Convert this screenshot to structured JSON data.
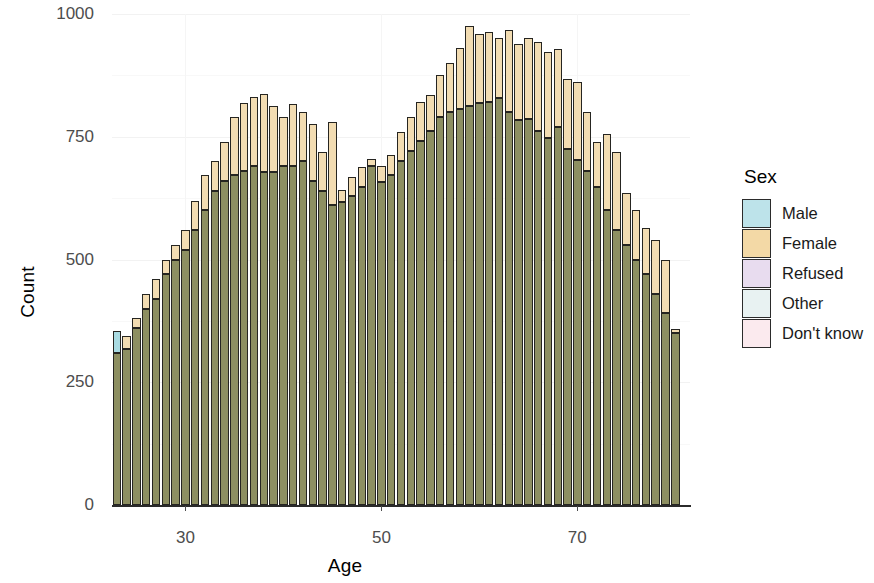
{
  "chart_data": {
    "type": "bar",
    "title": "",
    "subtitle": "",
    "xlabel": "Age",
    "ylabel": "Count",
    "xlim": [
      22.5,
      81.5
    ],
    "ylim": [
      0,
      1000
    ],
    "xticks": [
      30,
      50,
      70
    ],
    "yticks": [
      0,
      250,
      500,
      750,
      1000
    ],
    "grid": true,
    "legend_position": "right",
    "legend_title": "Sex",
    "overlap_note": "Overlapping (identity position) histogram; Male bars drawn over Female bars, producing an olive blend where both overlap.",
    "x": [
      23,
      24,
      25,
      26,
      27,
      28,
      29,
      30,
      31,
      32,
      33,
      34,
      35,
      36,
      37,
      38,
      39,
      40,
      41,
      42,
      43,
      44,
      45,
      46,
      47,
      48,
      49,
      50,
      51,
      52,
      53,
      54,
      55,
      56,
      57,
      58,
      59,
      60,
      61,
      62,
      63,
      64,
      65,
      66,
      67,
      68,
      69,
      70,
      71,
      72,
      73,
      74,
      75,
      76,
      77,
      78,
      79,
      80
    ],
    "series": [
      {
        "name": "Male",
        "color": "#a9dbe2",
        "values": [
          355,
          318,
          360,
          400,
          420,
          470,
          500,
          520,
          560,
          600,
          640,
          660,
          672,
          680,
          690,
          678,
          678,
          690,
          690,
          700,
          660,
          640,
          612,
          618,
          630,
          648,
          690,
          658,
          672,
          700,
          720,
          742,
          762,
          790,
          800,
          806,
          812,
          818,
          820,
          828,
          800,
          784,
          786,
          762,
          748,
          770,
          726,
          702,
          680,
          648,
          600,
          560,
          530,
          500,
          470,
          430,
          392,
          350
        ]
      },
      {
        "name": "Female",
        "color": "#f2dcb2",
        "values": [
          310,
          345,
          380,
          430,
          460,
          500,
          530,
          560,
          620,
          672,
          700,
          740,
          790,
          818,
          830,
          838,
          812,
          790,
          816,
          800,
          776,
          720,
          780,
          642,
          668,
          688,
          705,
          690,
          712,
          760,
          790,
          820,
          836,
          876,
          900,
          930,
          976,
          960,
          964,
          952,
          968,
          938,
          952,
          944,
          922,
          928,
          868,
          862,
          800,
          740,
          756,
          718,
          636,
          600,
          564,
          540,
          500,
          358
        ]
      }
    ]
  },
  "axes": {
    "y_title": "Count",
    "x_title": "Age",
    "y_tick_labels": [
      "0",
      "250",
      "500",
      "750",
      "1000"
    ],
    "x_tick_labels": [
      "30",
      "50",
      "70"
    ]
  },
  "legend": {
    "title": "Sex",
    "items": [
      {
        "label": "Male",
        "color": "#bde3ea"
      },
      {
        "label": "Female",
        "color": "#f3d9a6"
      },
      {
        "label": "Refused",
        "color": "#e8dcef"
      },
      {
        "label": "Other",
        "color": "#e8f2f2"
      },
      {
        "label": "Don't know",
        "color": "#fbeaee"
      }
    ]
  },
  "colors": {
    "male": "#a9dbe2",
    "female": "#f2dcb2",
    "overlap": "#8d8f61",
    "bar_stroke": "#262521",
    "grid": "#f2f2f2",
    "axis_text": "#4d4d4d",
    "background": "#ffffff"
  }
}
